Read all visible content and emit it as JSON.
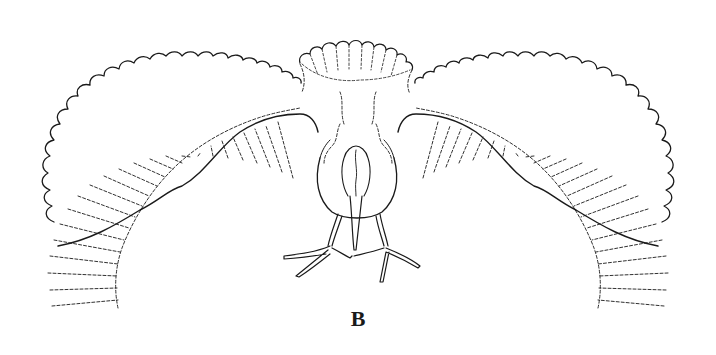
{
  "figure": {
    "label": "B",
    "colors": {
      "background": "#ffffff",
      "ink": "#1a1a1a"
    }
  }
}
